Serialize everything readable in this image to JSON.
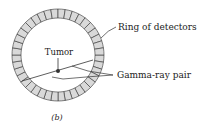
{
  "diagram": {
    "labels": {
      "ring": "Ring of detectors",
      "tumor": "Tumor",
      "gamma": "Gamma-ray pair",
      "caption": "(b)"
    },
    "colors": {
      "detector_fill": "#d9d9d9",
      "stroke": "#333333",
      "background": "#ffffff"
    },
    "ring": {
      "cx": 58,
      "cy": 55,
      "outer_r": 46,
      "inner_r": 37,
      "segments": 40
    }
  }
}
